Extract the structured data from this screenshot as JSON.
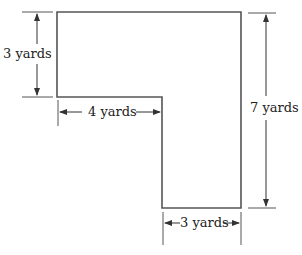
{
  "diagram": {
    "type": "L-shaped figure with dimensions",
    "stroke_color": "#444444",
    "labels": {
      "left_height": "3 yards",
      "inner_width": "4 yards",
      "right_height": "7 yards",
      "bottom_width": "3 yards"
    },
    "dimensions": {
      "left_height_value": 3,
      "inner_width_value": 4,
      "right_height_value": 7,
      "bottom_width_value": 3,
      "unit": "yards"
    }
  }
}
